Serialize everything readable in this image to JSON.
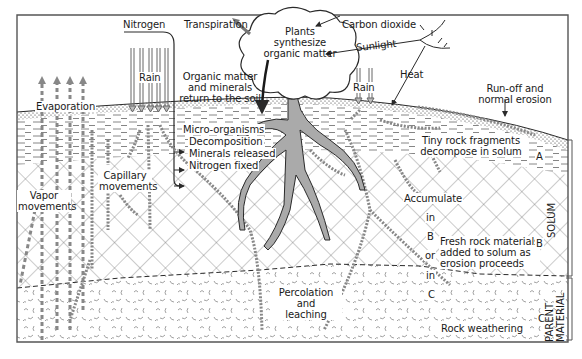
{
  "diagram": {
    "atmosphere_labels": {
      "nitrogen": "Nitrogen",
      "transpiration": "Transpiration",
      "carbon_dioxide": "Carbon dioxide",
      "sunlight": "Sunlight",
      "heat": "Heat",
      "rain_left": "Rain",
      "rain_right": "Rain",
      "evaporation": "Evaporation",
      "runoff_line1": "Run-off and",
      "runoff_line2": "normal erosion"
    },
    "plant": {
      "line1": "Plants",
      "line2": "synthesize",
      "line3": "organic matter",
      "return_line1": "Organic matter",
      "return_line2": "and minerals",
      "return_line3": "return to the soil"
    },
    "soil_processes": {
      "micro_organisms": "Micro-organisms",
      "decomposition": "Decomposition",
      "minerals_released": "Minerals released",
      "nitrogen_fixed": "Nitrogen fixed",
      "tiny_rock_line1": "Tiny rock fragments",
      "tiny_rock_line2": "decompose in solum",
      "capillary_line1": "Capillary",
      "capillary_line2": "movements",
      "vapor_line1": "Vapor",
      "vapor_line2": "movements",
      "accumulate": "Accumulate",
      "in_1": "in",
      "b_mid": "B",
      "or": "or",
      "in_2": "in",
      "c_mid": "C",
      "fresh_line1": "Fresh rock materials",
      "fresh_line2": "added to solum as",
      "fresh_line3": "erosion proceeds",
      "percolation_line1": "Percolation",
      "percolation_line2": "and",
      "percolation_line3": "leaching",
      "rock_weathering": "Rock weathering"
    },
    "horizons": {
      "a": "A",
      "b": "B",
      "c": "C",
      "solum": "SOLUM",
      "parent_line1": "PARENT",
      "parent_line2": "MATERIAL"
    },
    "colors": {
      "line": "#2a2a2a",
      "frame": "#555555",
      "hatch": "#6a6a6a",
      "arrow_fill": "#9a9a9a"
    }
  }
}
